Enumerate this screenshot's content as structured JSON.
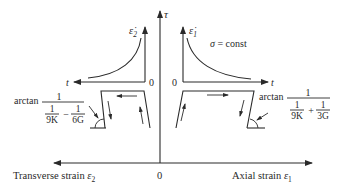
{
  "main_axes": {
    "vertical_label": "τ",
    "origin_label": "0",
    "left_label": "Transverse strain ",
    "left_symbol": "ε",
    "left_sub": "2",
    "right_label": "Axial strain ",
    "right_symbol": "ε",
    "right_sub": "1"
  },
  "left_inset": {
    "y_symbol": "ε̇",
    "y_sub": "2",
    "x_label": "t",
    "origin_label": "0"
  },
  "right_inset": {
    "y_symbol": "ε̇",
    "y_sub": "1",
    "x_label": "t",
    "origin_label": "0",
    "condition": "σ = const"
  },
  "left_angle": {
    "prefix": "arctan",
    "numerator": "1",
    "term1_num": "1",
    "term1_den": "9K",
    "operator": "−",
    "term2_num": "1",
    "term2_den": "6G"
  },
  "right_angle": {
    "prefix": "arctan",
    "numerator": "1",
    "term1_num": "1",
    "term1_den": "9K",
    "operator": "+",
    "term2_num": "1",
    "term2_den": "3G"
  }
}
